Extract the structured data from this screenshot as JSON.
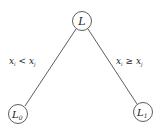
{
  "nodes": {
    "root": {
      "label": "L",
      "cx": 82,
      "cy": 21
    },
    "left": {
      "label": "L",
      "sub": "0",
      "cx": 18,
      "cy": 114
    },
    "right": {
      "label": "L",
      "sub": "1",
      "cx": 143,
      "cy": 112
    }
  },
  "edges": {
    "left": {
      "var1": "x",
      "sub1": "i",
      "op": " < ",
      "var2": "x",
      "sub2": "j"
    },
    "right": {
      "var1": "x",
      "sub1": "i",
      "op": " ≥ ",
      "var2": "x",
      "sub2": "j"
    }
  }
}
